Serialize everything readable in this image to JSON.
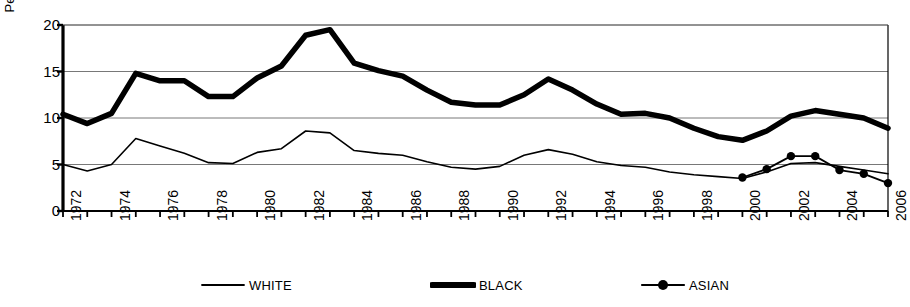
{
  "chart_data": {
    "type": "line",
    "title": "",
    "subtitle": "",
    "xlabel": "",
    "ylabel": "Percent",
    "xlim": [
      1972,
      2006
    ],
    "ylim": [
      0,
      20
    ],
    "yticks": [
      0,
      5,
      10,
      15,
      20
    ],
    "xticks": [
      1972,
      1974,
      1976,
      1978,
      1980,
      1982,
      1984,
      1986,
      1988,
      1990,
      1992,
      1994,
      1996,
      1998,
      2000,
      2002,
      2004,
      2006
    ],
    "xtick_labels": [
      "1972",
      "1974",
      "1976",
      "1978",
      "1980",
      "1982",
      "1984",
      "1986",
      "1988",
      "1990",
      "1992",
      "1994",
      "1996",
      "1998",
      "2000",
      "2002",
      "2004",
      "2006"
    ],
    "ytick_labels": [
      "0",
      "5",
      "10",
      "15",
      "20"
    ],
    "grid": "horizontal",
    "legend_position": "bottom",
    "x": [
      1972,
      1973,
      1974,
      1975,
      1976,
      1977,
      1978,
      1979,
      1980,
      1981,
      1982,
      1983,
      1984,
      1985,
      1986,
      1987,
      1988,
      1989,
      1990,
      1991,
      1992,
      1993,
      1994,
      1995,
      1996,
      1997,
      1998,
      1999,
      2000,
      2001,
      2002,
      2003,
      2004,
      2005,
      2006
    ],
    "series": [
      {
        "name": "WHITE",
        "style": "thin-line",
        "color": "#000000",
        "x": [
          1972,
          1973,
          1974,
          1975,
          1976,
          1977,
          1978,
          1979,
          1980,
          1981,
          1982,
          1983,
          1984,
          1985,
          1986,
          1987,
          1988,
          1989,
          1990,
          1991,
          1992,
          1993,
          1994,
          1995,
          1996,
          1997,
          1998,
          1999,
          2000,
          2001,
          2002,
          2003,
          2004,
          2005,
          2006
        ],
        "values": [
          5.0,
          4.3,
          5.0,
          7.8,
          7.0,
          6.2,
          5.2,
          5.1,
          6.3,
          6.7,
          8.6,
          8.4,
          6.5,
          6.2,
          6.0,
          5.3,
          4.7,
          4.5,
          4.8,
          6.0,
          6.6,
          6.1,
          5.3,
          4.9,
          4.7,
          4.2,
          3.9,
          3.7,
          3.5,
          4.2,
          5.1,
          5.2,
          4.8,
          4.4,
          4.0
        ]
      },
      {
        "name": "BLACK",
        "style": "thick-line",
        "color": "#000000",
        "x": [
          1972,
          1973,
          1974,
          1975,
          1976,
          1977,
          1978,
          1979,
          1980,
          1981,
          1982,
          1983,
          1984,
          1985,
          1986,
          1987,
          1988,
          1989,
          1990,
          1991,
          1992,
          1993,
          1994,
          1995,
          1996,
          1997,
          1998,
          1999,
          2000,
          2001,
          2002,
          2003,
          2004,
          2005,
          2006
        ],
        "values": [
          10.4,
          9.4,
          10.5,
          14.8,
          14.0,
          14.0,
          12.3,
          12.3,
          14.3,
          15.6,
          18.9,
          19.5,
          15.9,
          15.1,
          14.5,
          13.0,
          11.7,
          11.4,
          11.4,
          12.5,
          14.2,
          13.0,
          11.5,
          10.4,
          10.5,
          10.0,
          8.9,
          8.0,
          7.6,
          8.6,
          10.2,
          10.8,
          10.4,
          10.0,
          8.9
        ]
      },
      {
        "name": "ASIAN",
        "style": "marker-line",
        "color": "#000000",
        "x": [
          2000,
          2001,
          2002,
          2003,
          2004,
          2005,
          2006
        ],
        "values": [
          3.6,
          4.5,
          5.9,
          5.9,
          4.4,
          4.0,
          3.0
        ]
      }
    ],
    "legend": [
      {
        "label": "WHITE",
        "style": "thin-line"
      },
      {
        "label": "BLACK",
        "style": "thick-line"
      },
      {
        "label": "ASIAN",
        "style": "marker-line"
      }
    ]
  }
}
